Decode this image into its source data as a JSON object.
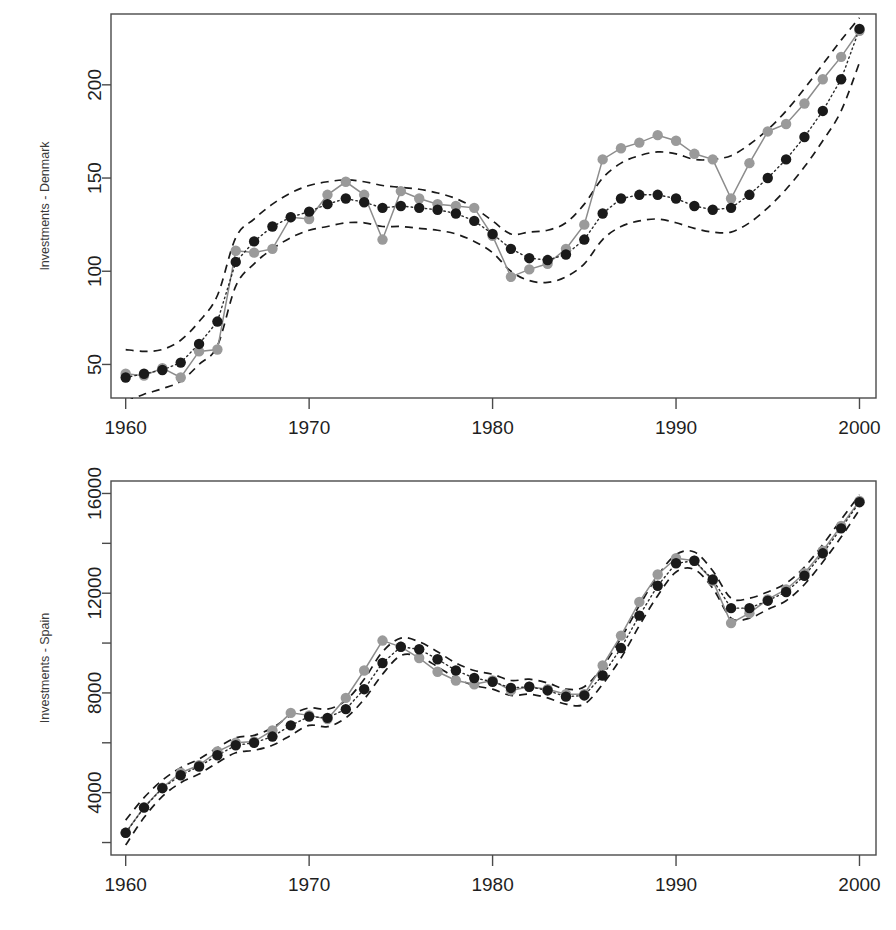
{
  "figure": {
    "kind": "two-panel-time-series",
    "background": "#ffffff",
    "colors": {
      "observed_point": "#9a9a9a",
      "observed_line": "#8c8c8c",
      "fitted_point": "#1a1a1a",
      "fitted_line": "#2b2b2b",
      "band": "#1a1a1a",
      "axis": "#4a4a4a",
      "text": "#1f1f1f"
    }
  },
  "panels": {
    "denmark": {
      "ylabel": "Investments - Denmark",
      "y_ticks": [
        "50",
        "100",
        "150",
        "200"
      ],
      "x_ticks": [
        "1960",
        "1970",
        "1980",
        "1990",
        "2000"
      ]
    },
    "spain": {
      "ylabel": "Investments - Spain",
      "y_ticks": [
        "4000",
        "8000",
        "12000",
        "16000"
      ],
      "x_ticks": [
        "1960",
        "1970",
        "1980",
        "1990",
        "2000"
      ]
    }
  },
  "chart_data": [
    {
      "type": "line",
      "title": "",
      "xlabel": "",
      "ylabel": "Investments - Denmark",
      "xlim": [
        1959.2,
        2000.9
      ],
      "ylim": [
        32,
        238
      ],
      "xticks": [
        1960,
        1970,
        1980,
        1990,
        2000
      ],
      "yticks": [
        50,
        100,
        150,
        200
      ],
      "grid": false,
      "legend": "none",
      "x": [
        1960,
        1961,
        1962,
        1963,
        1964,
        1965,
        1966,
        1967,
        1968,
        1969,
        1970,
        1971,
        1972,
        1973,
        1974,
        1975,
        1976,
        1977,
        1978,
        1979,
        1980,
        1981,
        1982,
        1983,
        1984,
        1985,
        1986,
        1987,
        1988,
        1989,
        1990,
        1991,
        1992,
        1993,
        1994,
        1995,
        1996,
        1997,
        1998,
        1999,
        2000
      ],
      "series": [
        {
          "name": "observed",
          "style": "solid-line-gray-points",
          "values": [
            45,
            44,
            48,
            43,
            57,
            58,
            111,
            110,
            112,
            129,
            128,
            141,
            148,
            141,
            117,
            143,
            139,
            136,
            135,
            134,
            119,
            97,
            101,
            104,
            112,
            125,
            160,
            166,
            169,
            173,
            170,
            163,
            160,
            139,
            158,
            175,
            179,
            190,
            203,
            215,
            229
          ]
        },
        {
          "name": "fitted",
          "style": "dotted-line-black-points",
          "values": [
            43,
            45,
            47,
            51,
            61,
            73,
            105,
            116,
            124,
            129,
            132,
            136,
            139,
            137,
            134,
            135,
            134,
            133,
            131,
            127,
            120,
            112,
            107,
            106,
            109,
            117,
            131,
            139,
            141,
            141,
            139,
            135,
            133,
            134,
            141,
            150,
            160,
            172,
            186,
            203,
            230
          ]
        },
        {
          "name": "upper-band",
          "style": "dashed",
          "values": [
            58,
            57,
            58,
            63,
            73,
            87,
            118,
            128,
            136,
            142,
            146,
            148,
            149,
            148,
            146,
            145,
            144,
            142,
            139,
            134,
            127,
            120,
            121,
            122,
            126,
            136,
            150,
            158,
            162,
            164,
            163,
            160,
            160,
            162,
            168,
            176,
            186,
            198,
            211,
            224,
            236
          ]
        },
        {
          "name": "lower-band",
          "style": "dashed",
          "values": [
            30,
            34,
            37,
            41,
            50,
            60,
            92,
            104,
            112,
            118,
            122,
            124,
            126,
            126,
            124,
            124,
            123,
            122,
            120,
            116,
            110,
            100,
            95,
            94,
            97,
            104,
            117,
            124,
            127,
            128,
            126,
            123,
            121,
            121,
            126,
            134,
            144,
            156,
            170,
            186,
            212
          ]
        }
      ]
    },
    {
      "type": "line",
      "title": "",
      "xlabel": "",
      "ylabel": "Investments - Spain",
      "xlim": [
        1959.2,
        2000.9
      ],
      "ylim": [
        1500,
        16500
      ],
      "xticks": [
        1960,
        1970,
        1980,
        1990,
        2000
      ],
      "yticks": [
        4000,
        8000,
        12000,
        16000
      ],
      "yticks_minor": [
        2000,
        6000,
        10000,
        14000
      ],
      "grid": false,
      "legend": "none",
      "x": [
        1960,
        1961,
        1962,
        1963,
        1964,
        1965,
        1966,
        1967,
        1968,
        1969,
        1970,
        1971,
        1972,
        1973,
        1974,
        1975,
        1976,
        1977,
        1978,
        1979,
        1980,
        1981,
        1982,
        1983,
        1984,
        1985,
        1986,
        1987,
        1988,
        1989,
        1990,
        1991,
        1992,
        1993,
        1994,
        1995,
        1996,
        1997,
        1998,
        1999,
        2000
      ],
      "series": [
        {
          "name": "observed",
          "style": "solid-line-gray-points",
          "values": [
            2390,
            3420,
            4200,
            4800,
            5100,
            5650,
            6000,
            6050,
            6500,
            7200,
            7100,
            6950,
            7800,
            8900,
            10100,
            9850,
            9400,
            8850,
            8500,
            8350,
            8500,
            8100,
            8250,
            8150,
            7950,
            7950,
            9100,
            10300,
            11650,
            12750,
            13400,
            13300,
            12500,
            10800,
            11200,
            11750,
            12150,
            12800,
            13700,
            14700,
            15700
          ]
        },
        {
          "name": "fitted",
          "style": "dotted-line-black-points",
          "values": [
            2390,
            3400,
            4180,
            4700,
            5050,
            5500,
            5900,
            6000,
            6250,
            6700,
            7050,
            7000,
            7350,
            8150,
            9200,
            9850,
            9750,
            9350,
            8900,
            8600,
            8450,
            8200,
            8250,
            8100,
            7850,
            7900,
            8700,
            9800,
            11100,
            12300,
            13200,
            13300,
            12550,
            11400,
            11400,
            11700,
            12050,
            12700,
            13600,
            14600,
            15650
          ]
        },
        {
          "name": "upper-band",
          "style": "dashed",
          "values": [
            2900,
            3800,
            4500,
            5000,
            5350,
            5800,
            6200,
            6300,
            6600,
            7100,
            7400,
            7350,
            7700,
            8550,
            9650,
            10200,
            10050,
            9650,
            9200,
            8900,
            8750,
            8500,
            8550,
            8400,
            8150,
            8250,
            9050,
            10200,
            11500,
            12700,
            13550,
            13650,
            12900,
            11800,
            11800,
            12050,
            12400,
            13050,
            13950,
            14950,
            15950
          ]
        },
        {
          "name": "lower-band",
          "style": "dashed",
          "values": [
            1900,
            3000,
            3850,
            4400,
            4750,
            5200,
            5600,
            5700,
            5900,
            6300,
            6700,
            6650,
            7000,
            7750,
            8750,
            9500,
            9450,
            9050,
            8600,
            8300,
            8150,
            7900,
            7950,
            7800,
            7550,
            7550,
            8350,
            9400,
            10700,
            11900,
            12850,
            12950,
            12200,
            11000,
            11000,
            11350,
            11700,
            12350,
            13250,
            14250,
            15350
          ]
        }
      ]
    }
  ]
}
